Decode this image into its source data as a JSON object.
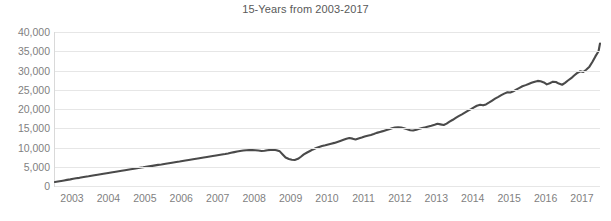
{
  "chart_data": {
    "type": "line",
    "title": "15-Years from 2003-2017",
    "xlabel": "",
    "ylabel": "",
    "grid": true,
    "legend": false,
    "legend_position": "none",
    "line_color": "#4a4a4a",
    "grid_color": "#e6e6e6",
    "axis_color": "#d9d9d9",
    "tick_label_color": "#7f7f7f",
    "title_color": "#595959",
    "xlim": [
      2003.0,
      2017.96
    ],
    "ylim": [
      0,
      40000
    ],
    "xtick_labels": [
      "2003",
      "2004",
      "2005",
      "2006",
      "2007",
      "2008",
      "2009",
      "2010",
      "2011",
      "2012",
      "2013",
      "2014",
      "2015",
      "2016",
      "2017"
    ],
    "xtick_values": [
      2003,
      2004,
      2005,
      2006,
      2007,
      2008,
      2009,
      2010,
      2011,
      2012,
      2013,
      2014,
      2015,
      2016,
      2017
    ],
    "ytick_labels": [
      "0",
      "5,000",
      "10,000",
      "15,000",
      "20,000",
      "25,000",
      "30,000",
      "35,000",
      "40,000"
    ],
    "ytick_values": [
      0,
      5000,
      10000,
      15000,
      20000,
      25000,
      30000,
      35000,
      40000
    ],
    "series": [
      {
        "name": "Cumulative value",
        "x": [
          2003.0,
          2003.08,
          2003.17,
          2003.25,
          2003.33,
          2003.42,
          2003.5,
          2003.58,
          2003.67,
          2003.75,
          2003.83,
          2003.92,
          2004.0,
          2004.08,
          2004.17,
          2004.25,
          2004.33,
          2004.42,
          2004.5,
          2004.58,
          2004.67,
          2004.75,
          2004.83,
          2004.92,
          2005.0,
          2005.08,
          2005.17,
          2005.25,
          2005.33,
          2005.42,
          2005.5,
          2005.58,
          2005.67,
          2005.75,
          2005.83,
          2005.92,
          2006.0,
          2006.08,
          2006.17,
          2006.25,
          2006.33,
          2006.42,
          2006.5,
          2006.58,
          2006.67,
          2006.75,
          2006.83,
          2006.92,
          2007.0,
          2007.08,
          2007.17,
          2007.25,
          2007.33,
          2007.42,
          2007.5,
          2007.58,
          2007.67,
          2007.75,
          2007.83,
          2007.92,
          2008.0,
          2008.08,
          2008.17,
          2008.25,
          2008.33,
          2008.42,
          2008.5,
          2008.58,
          2008.67,
          2008.75,
          2008.83,
          2008.92,
          2009.0,
          2009.08,
          2009.17,
          2009.25,
          2009.33,
          2009.42,
          2009.5,
          2009.58,
          2009.67,
          2009.75,
          2009.83,
          2009.92,
          2010.0,
          2010.08,
          2010.17,
          2010.25,
          2010.33,
          2010.42,
          2010.5,
          2010.58,
          2010.67,
          2010.75,
          2010.83,
          2010.92,
          2011.0,
          2011.08,
          2011.17,
          2011.25,
          2011.33,
          2011.42,
          2011.5,
          2011.58,
          2011.67,
          2011.75,
          2011.83,
          2011.92,
          2012.0,
          2012.08,
          2012.17,
          2012.25,
          2012.33,
          2012.42,
          2012.5,
          2012.58,
          2012.67,
          2012.75,
          2012.83,
          2012.92,
          2013.0,
          2013.08,
          2013.17,
          2013.25,
          2013.33,
          2013.42,
          2013.5,
          2013.58,
          2013.67,
          2013.75,
          2013.83,
          2013.92,
          2014.0,
          2014.08,
          2014.17,
          2014.25,
          2014.33,
          2014.42,
          2014.5,
          2014.58,
          2014.67,
          2014.75,
          2014.83,
          2014.92,
          2015.0,
          2015.08,
          2015.17,
          2015.25,
          2015.33,
          2015.42,
          2015.5,
          2015.58,
          2015.67,
          2015.75,
          2015.83,
          2015.92,
          2016.0,
          2016.08,
          2016.17,
          2016.25,
          2016.33,
          2016.42,
          2016.5,
          2016.58,
          2016.67,
          2016.75,
          2016.83,
          2016.92,
          2017.0,
          2017.08,
          2017.17,
          2017.25,
          2017.33,
          2017.42,
          2017.5,
          2017.58,
          2017.67,
          2017.75,
          2017.83,
          2017.92
        ],
        "values": [
          1050,
          1180,
          1320,
          1450,
          1590,
          1720,
          1860,
          1990,
          2120,
          2260,
          2390,
          2520,
          2660,
          2790,
          2920,
          3050,
          3180,
          3310,
          3440,
          3570,
          3700,
          3830,
          3960,
          4090,
          4220,
          4350,
          4470,
          4600,
          4730,
          4850,
          4980,
          5100,
          5230,
          5350,
          5480,
          5600,
          5730,
          5850,
          5980,
          6100,
          6230,
          6350,
          6480,
          6610,
          6740,
          6870,
          7000,
          7130,
          7260,
          7390,
          7520,
          7650,
          7780,
          7910,
          8040,
          8170,
          8300,
          8450,
          8620,
          8800,
          8950,
          9080,
          9200,
          9300,
          9350,
          9330,
          9280,
          9200,
          9100,
          9150,
          9300,
          9380,
          9400,
          9300,
          9000,
          8200,
          7400,
          7000,
          6800,
          6750,
          7050,
          7600,
          8200,
          8700,
          9100,
          9500,
          9850,
          10150,
          10400,
          10600,
          10800,
          11000,
          11200,
          11450,
          11700,
          12000,
          12250,
          12450,
          12300,
          12100,
          12350,
          12600,
          12850,
          13050,
          13250,
          13500,
          13800,
          14050,
          14250,
          14500,
          14750,
          15000,
          15180,
          15250,
          15200,
          15000,
          14750,
          14500,
          14400,
          14600,
          14850,
          15050,
          15250,
          15450,
          15650,
          15900,
          16150,
          16000,
          15850,
          16200,
          16700,
          17200,
          17700,
          18150,
          18600,
          19050,
          19500,
          19950,
          20400,
          20850,
          21100,
          20950,
          21200,
          21700,
          22200,
          22700,
          23150,
          23600,
          24000,
          24350,
          24300,
          24600,
          25100,
          25500,
          25900,
          26200,
          26500,
          26800,
          27100,
          27300,
          27200,
          26900,
          26400,
          26700,
          27100,
          27000,
          26600,
          26300,
          26800,
          27400,
          28000,
          28700,
          29300,
          29800,
          29600,
          30200,
          31000,
          32200,
          33600,
          35000
        ],
        "end_value": 37000,
        "start_value": 1050,
        "min_value": 1050,
        "max_value": 37000
      }
    ]
  }
}
